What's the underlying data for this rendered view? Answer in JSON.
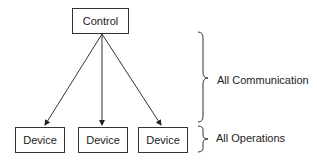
{
  "diagram": {
    "control": {
      "label": "Control"
    },
    "devices": [
      {
        "label": "Device"
      },
      {
        "label": "Device"
      },
      {
        "label": "Device"
      }
    ],
    "braces": [
      {
        "label": "All Communication"
      },
      {
        "label": "All Operations"
      }
    ]
  }
}
